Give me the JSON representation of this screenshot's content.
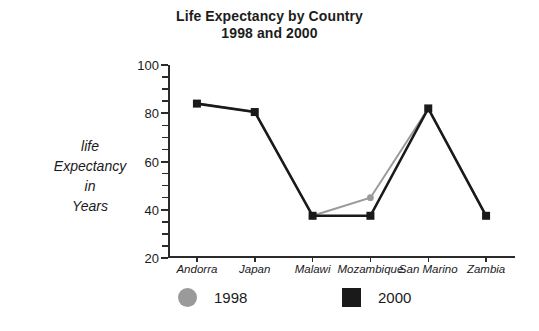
{
  "chart_data": {
    "type": "line",
    "title": "Life Expectancy by Country",
    "subtitle": "1998 and 2000",
    "title_lines": [
      "Life Expectancy by Country",
      "1998 and 2000"
    ],
    "xlabel": "",
    "ylabel": "life Expectancy in Years",
    "ylabel_lines": [
      "life",
      "Expectancy",
      "in",
      "Years"
    ],
    "categories": [
      "Andorra",
      "Japan",
      "Malawi",
      "Mozambique",
      "San Marino",
      "Zambia"
    ],
    "series": [
      {
        "name": "1998",
        "color": "#9a9a9a",
        "marker": "circle",
        "values": [
          84,
          80.5,
          37.5,
          45,
          82,
          37.5
        ]
      },
      {
        "name": "2000",
        "color": "#1a1a1a",
        "marker": "square",
        "values": [
          84,
          80.5,
          37.5,
          37.5,
          82,
          37.5
        ]
      }
    ],
    "ylim": [
      20,
      100
    ],
    "ytick_values": [
      20,
      40,
      60,
      80,
      100
    ],
    "ytick_labels": [
      "20",
      "40",
      "60",
      "80",
      "100"
    ],
    "yminor_step": 5,
    "grid": false,
    "legend_position": "bottom"
  },
  "legend": {
    "entries": [
      {
        "label": "1998",
        "swatch": "gray-circle-marker"
      },
      {
        "label": "2000",
        "swatch": "black-square-marker"
      }
    ]
  }
}
